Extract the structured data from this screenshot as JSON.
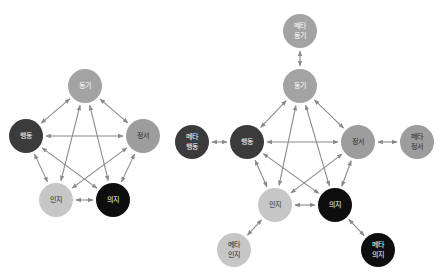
{
  "colors": {
    "arrow": "#8a8a8a",
    "motivation": "#a3a3a3",
    "behavior": "#3b3b3b",
    "emotion": "#9d9d9d",
    "cognition": "#c6c6c6",
    "volition": "#0e0e0e",
    "text_light": "#ffffff",
    "text_dark": "#2a2a2a"
  },
  "diagrams": [
    {
      "id": "left",
      "nodes": [
        {
          "key": "motivation",
          "label": "동기",
          "x": 85,
          "y": 86,
          "r": 17,
          "fill": "#a3a3a3",
          "text": "#ffffff"
        },
        {
          "key": "behavior",
          "label": "행동",
          "x": 26,
          "y": 136,
          "r": 17,
          "fill": "#3b3b3b",
          "text": "#ffffff"
        },
        {
          "key": "emotion",
          "label": "정서",
          "x": 143,
          "y": 136,
          "r": 17,
          "fill": "#9d9d9d",
          "text": "#2a2a2a"
        },
        {
          "key": "cognition",
          "label": "인지",
          "x": 56,
          "y": 200,
          "r": 17,
          "fill": "#c6c6c6",
          "text": "#2a2a2a"
        },
        {
          "key": "volition",
          "label": "의지",
          "x": 113,
          "y": 200,
          "r": 17,
          "fill": "#0e0e0e",
          "text": "#ffffff"
        }
      ],
      "edges": [
        [
          "motivation",
          "behavior"
        ],
        [
          "motivation",
          "emotion"
        ],
        [
          "motivation",
          "cognition"
        ],
        [
          "motivation",
          "volition"
        ],
        [
          "behavior",
          "emotion"
        ],
        [
          "behavior",
          "cognition"
        ],
        [
          "behavior",
          "volition"
        ],
        [
          "emotion",
          "cognition"
        ],
        [
          "emotion",
          "volition"
        ],
        [
          "cognition",
          "volition"
        ]
      ]
    },
    {
      "id": "right",
      "nodes": [
        {
          "key": "meta_motivation",
          "label": "메타\n동기",
          "x": 300,
          "y": 31,
          "r": 17,
          "fill": "#a3a3a3",
          "text": "#ffffff"
        },
        {
          "key": "motivation",
          "label": "동기",
          "x": 300,
          "y": 86,
          "r": 17,
          "fill": "#a3a3a3",
          "text": "#ffffff"
        },
        {
          "key": "behavior",
          "label": "행동",
          "x": 247,
          "y": 142,
          "r": 17,
          "fill": "#3b3b3b",
          "text": "#ffffff"
        },
        {
          "key": "meta_behavior",
          "label": "메타\n행동",
          "x": 192,
          "y": 142,
          "r": 17,
          "fill": "#3b3b3b",
          "text": "#ffffff"
        },
        {
          "key": "emotion",
          "label": "정서",
          "x": 358,
          "y": 142,
          "r": 17,
          "fill": "#9d9d9d",
          "text": "#2a2a2a"
        },
        {
          "key": "meta_emotion",
          "label": "메타\n정서",
          "x": 417,
          "y": 142,
          "r": 17,
          "fill": "#9d9d9d",
          "text": "#2a2a2a"
        },
        {
          "key": "cognition",
          "label": "인지",
          "x": 275,
          "y": 205,
          "r": 17,
          "fill": "#c6c6c6",
          "text": "#2a2a2a"
        },
        {
          "key": "volition",
          "label": "의지",
          "x": 335,
          "y": 205,
          "r": 17,
          "fill": "#0e0e0e",
          "text": "#ffffff"
        },
        {
          "key": "meta_cognition",
          "label": "메타\n인지",
          "x": 234,
          "y": 250,
          "r": 17,
          "fill": "#c6c6c6",
          "text": "#2a2a2a"
        },
        {
          "key": "meta_volition",
          "label": "메타\n의지",
          "x": 378,
          "y": 250,
          "r": 17,
          "fill": "#0e0e0e",
          "text": "#ffffff"
        }
      ],
      "edges": [
        [
          "meta_motivation",
          "motivation"
        ],
        [
          "meta_behavior",
          "behavior"
        ],
        [
          "emotion",
          "meta_emotion"
        ],
        [
          "cognition",
          "meta_cognition"
        ],
        [
          "volition",
          "meta_volition"
        ],
        [
          "motivation",
          "behavior"
        ],
        [
          "motivation",
          "emotion"
        ],
        [
          "motivation",
          "cognition"
        ],
        [
          "motivation",
          "volition"
        ],
        [
          "behavior",
          "emotion"
        ],
        [
          "behavior",
          "cognition"
        ],
        [
          "behavior",
          "volition"
        ],
        [
          "emotion",
          "cognition"
        ],
        [
          "emotion",
          "volition"
        ],
        [
          "cognition",
          "volition"
        ]
      ]
    }
  ]
}
